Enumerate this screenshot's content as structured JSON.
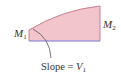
{
  "diagram": {
    "labels": {
      "m1": {
        "symbol": "M",
        "subscript": "1"
      },
      "m2": {
        "symbol": "M",
        "subscript": "2"
      },
      "slope": {
        "prefix": "Slope = ",
        "symbol": "V",
        "subscript": "1"
      }
    },
    "colors": {
      "fill": "#f2c4cc",
      "curve": "#c9808e",
      "baseline": "#7b7bd6",
      "edges": "#c9808e",
      "leader": "#555555",
      "text": "#333333"
    },
    "shape": {
      "left_x": 29,
      "right_x": 100,
      "baseline_y": 41,
      "left_top_y": 30,
      "right_top_y": 6
    }
  }
}
